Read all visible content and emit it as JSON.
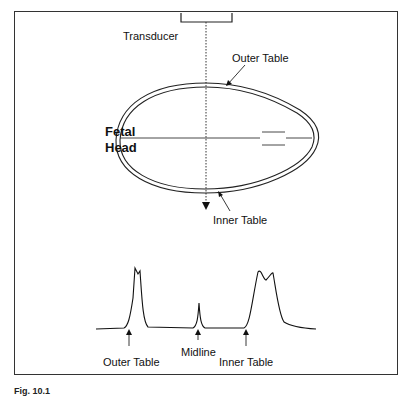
{
  "diagram": {
    "top": {
      "transducer_label": "Transducer",
      "outer_table_label": "Outer Table",
      "inner_table_label": "Inner Table",
      "fetal_head_label_line1": "Fetal",
      "fetal_head_label_line2": "Head"
    },
    "bottom": {
      "outer_table_label": "Outer Table",
      "midline_label": "Midline",
      "inner_table_label": "Inner Table"
    },
    "caption": "Fig. 10.1"
  }
}
